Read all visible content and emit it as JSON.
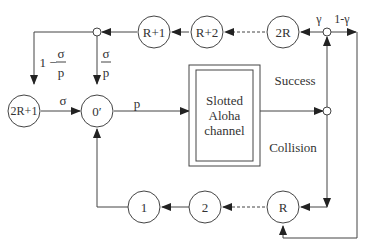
{
  "diagram": {
    "title": "",
    "nodes": {
      "r_plus_1": "R+1",
      "r_plus_2": "R+2",
      "two_r": "2R",
      "two_r_plus_1": "2R+1",
      "zero_prime": "0′",
      "one": "1",
      "two": "2",
      "r": "R"
    },
    "channel": {
      "line1": "Slotted",
      "line2": "Aloha",
      "line3": "channel"
    },
    "labels": {
      "success": "Success",
      "collision": "Collision",
      "gamma": "γ",
      "one_minus_gamma": "1-γ",
      "sigma": "σ",
      "p": "p",
      "one_minus": "1 −",
      "frac_num": "σ",
      "frac_den": "p"
    }
  }
}
